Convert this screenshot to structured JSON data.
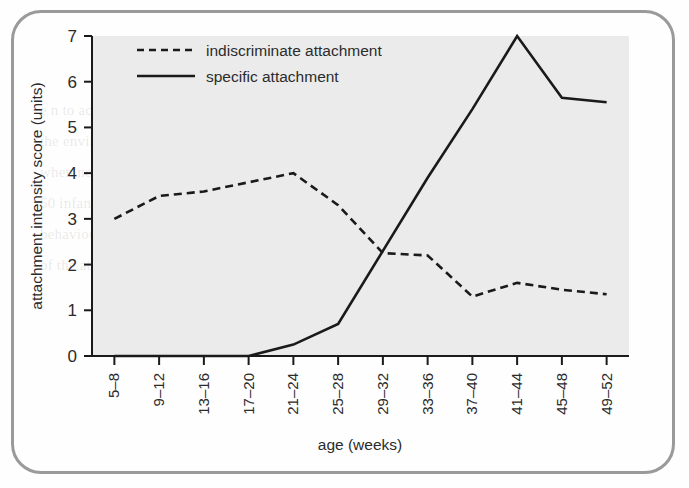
{
  "figure": {
    "background_color": "#ebebeb",
    "border_color": "#9a9a9a",
    "line_color": "#1a1a1a",
    "ghost_text": "e n to act as a secure base, so that the child can explore\nthe environment and return to the adult for reassurance\nwhen needed.  Schaffer and Emerson (1964) studied\n60 infants and recorded the age at which attachment\nbehaviours first appeared, along with the intensity\nof the attachment shown to the care-giver."
  },
  "chart_data": {
    "type": "line",
    "title": "",
    "xlabel": "age (weeks)",
    "ylabel": "attachment intensity score (units)",
    "ylim": [
      0,
      7
    ],
    "yticks": [
      0,
      1,
      2,
      3,
      4,
      5,
      6,
      7
    ],
    "grid": false,
    "legend_position": "top-left",
    "categories": [
      "5–8",
      "9–12",
      "13–16",
      "17–20",
      "21–24",
      "25–28",
      "29–32",
      "33–36",
      "37–40",
      "41–44",
      "45–48",
      "49–52"
    ],
    "series": [
      {
        "name": "indiscriminate attachment",
        "style": "dashed",
        "values": [
          3.0,
          3.5,
          3.6,
          3.8,
          4.0,
          3.3,
          2.25,
          2.2,
          1.3,
          1.6,
          1.45,
          1.35
        ]
      },
      {
        "name": "specific attachment",
        "style": "solid",
        "values": [
          0.0,
          0.0,
          0.0,
          0.0,
          0.25,
          0.7,
          2.3,
          3.9,
          5.4,
          7.0,
          5.65,
          5.55
        ]
      }
    ]
  },
  "legend": {
    "items": [
      {
        "label": "indiscriminate attachment",
        "style": "dashed"
      },
      {
        "label": "specific attachment",
        "style": "solid"
      }
    ]
  },
  "axis_ticks": {
    "y": [
      "7",
      "6",
      "5",
      "4",
      "3",
      "2",
      "1",
      "0"
    ]
  }
}
